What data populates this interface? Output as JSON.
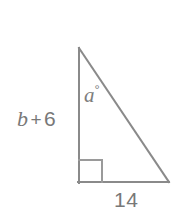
{
  "figure": {
    "type": "right-triangle-diagram",
    "canvas": {
      "width": 175,
      "height": 214,
      "background": "#ffffff"
    },
    "stroke_color": "#8a8a8a",
    "stroke_width": 2,
    "text_color": "#787878",
    "vertices": {
      "apex": {
        "x": 79,
        "y": 48
      },
      "right_angle": {
        "x": 79,
        "y": 182
      },
      "base_right": {
        "x": 169,
        "y": 182
      }
    },
    "right_angle_marker": {
      "x": 79,
      "y": 160,
      "size": 23
    },
    "labels": {
      "left_leg": {
        "full_text": "b + 6",
        "variable": "b",
        "operator": "+",
        "number": "6"
      },
      "angle": {
        "full_text": "a°",
        "variable": "a",
        "degree_symbol": "°"
      },
      "base": "14"
    }
  }
}
